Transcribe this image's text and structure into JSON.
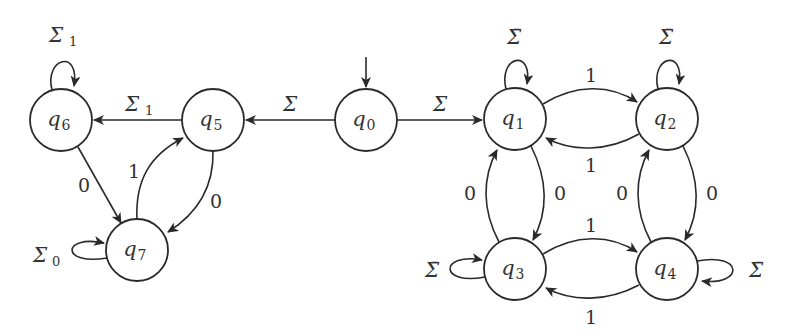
{
  "diagram": {
    "type": "finite-automaton",
    "start_state": "q0",
    "states": [
      {
        "id": "q0",
        "base": "q",
        "sub": "0",
        "cx": 366,
        "cy": 120
      },
      {
        "id": "q1",
        "base": "q",
        "sub": "1",
        "cx": 515,
        "cy": 119
      },
      {
        "id": "q2",
        "base": "q",
        "sub": "2",
        "cx": 667,
        "cy": 119
      },
      {
        "id": "q3",
        "base": "q",
        "sub": "3",
        "cx": 515,
        "cy": 269
      },
      {
        "id": "q4",
        "base": "q",
        "sub": "4",
        "cx": 667,
        "cy": 269
      },
      {
        "id": "q5",
        "base": "q",
        "sub": "5",
        "cx": 213,
        "cy": 120
      },
      {
        "id": "q6",
        "base": "q",
        "sub": "6",
        "cx": 61,
        "cy": 120
      },
      {
        "id": "q7",
        "base": "q",
        "sub": "7",
        "cx": 137,
        "cy": 250
      }
    ],
    "transitions": [
      {
        "from": "q0",
        "to": "q5",
        "label": "Σ",
        "sub": ""
      },
      {
        "from": "q0",
        "to": "q1",
        "label": "Σ",
        "sub": ""
      },
      {
        "from": "q5",
        "to": "q6",
        "label": "Σ",
        "sub": "1"
      },
      {
        "from": "q6",
        "to": "q6",
        "label": "Σ",
        "sub": "1"
      },
      {
        "from": "q6",
        "to": "q7",
        "label": "0",
        "sub": ""
      },
      {
        "from": "q7",
        "to": "q5",
        "label": "1",
        "sub": ""
      },
      {
        "from": "q5",
        "to": "q7",
        "label": "0",
        "sub": ""
      },
      {
        "from": "q7",
        "to": "q7",
        "label": "Σ",
        "sub": "0"
      },
      {
        "from": "q1",
        "to": "q1",
        "label": "Σ̄",
        "sub": ""
      },
      {
        "from": "q2",
        "to": "q2",
        "label": "Σ̄",
        "sub": ""
      },
      {
        "from": "q3",
        "to": "q3",
        "label": "Σ̄",
        "sub": ""
      },
      {
        "from": "q4",
        "to": "q4",
        "label": "Σ̄",
        "sub": ""
      },
      {
        "from": "q1",
        "to": "q2",
        "label": "1",
        "sub": ""
      },
      {
        "from": "q2",
        "to": "q1",
        "label": "1",
        "sub": ""
      },
      {
        "from": "q3",
        "to": "q4",
        "label": "1",
        "sub": ""
      },
      {
        "from": "q4",
        "to": "q3",
        "label": "1",
        "sub": ""
      },
      {
        "from": "q1",
        "to": "q3",
        "label": "0",
        "sub": ""
      },
      {
        "from": "q3",
        "to": "q1",
        "label": "0",
        "sub": ""
      },
      {
        "from": "q2",
        "to": "q4",
        "label": "0",
        "sub": ""
      },
      {
        "from": "q4",
        "to": "q2",
        "label": "0",
        "sub": ""
      }
    ]
  },
  "labels": {
    "q0": {
      "base": "q",
      "sub": "0"
    },
    "q1": {
      "base": "q",
      "sub": "1"
    },
    "q2": {
      "base": "q",
      "sub": "2"
    },
    "q3": {
      "base": "q",
      "sub": "3"
    },
    "q4": {
      "base": "q",
      "sub": "4"
    },
    "q5": {
      "base": "q",
      "sub": "5"
    },
    "q6": {
      "base": "q",
      "sub": "6"
    },
    "q7": {
      "base": "q",
      "sub": "7"
    },
    "sigma": "Σ",
    "sigma_bar": "Σ̄",
    "sub1": "1",
    "sub0": "0",
    "zero": "0",
    "one": "1"
  }
}
